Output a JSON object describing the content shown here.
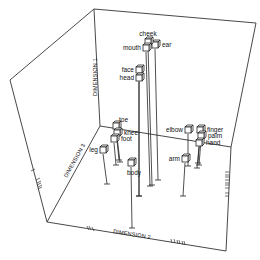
{
  "chart_data": {
    "type": "scatter",
    "subtype": "3d-scatter-with-drop-lines",
    "title": "",
    "axes": {
      "x": {
        "label": "DIMENSION 2"
      },
      "y": {
        "label": "DIMENSION 3"
      },
      "z": {
        "label": "DIMENSION 1"
      }
    },
    "grid": false,
    "legend": null,
    "points": [
      {
        "label": "cheek",
        "screen": [
          148,
          42
        ],
        "floor": [
          152,
          185
        ]
      },
      {
        "label": "mouth",
        "screen": [
          146,
          48
        ],
        "floor": [
          150,
          186
        ]
      },
      {
        "label": "ear",
        "screen": [
          155,
          45
        ],
        "floor": [
          158,
          180
        ]
      },
      {
        "label": "face",
        "screen": [
          139,
          70
        ],
        "floor": [
          139,
          196
        ]
      },
      {
        "label": "head",
        "screen": [
          139,
          78
        ],
        "floor": [
          139,
          196
        ]
      },
      {
        "label": "toe",
        "screen": [
          116,
          126
        ],
        "floor": [
          119,
          160
        ]
      },
      {
        "label": "knee",
        "screen": [
          117,
          133
        ],
        "floor": [
          120,
          162
        ]
      },
      {
        "label": "foot",
        "screen": [
          114,
          139
        ],
        "floor": [
          116,
          165
        ]
      },
      {
        "label": "leg",
        "screen": [
          103,
          150
        ],
        "floor": [
          107,
          184
        ]
      },
      {
        "label": "body",
        "screen": [
          131,
          163
        ],
        "floor": [
          132,
          228
        ]
      },
      {
        "label": "elbow",
        "screen": [
          188,
          130
        ],
        "floor": [
          188,
          166
        ]
      },
      {
        "label": "finger",
        "screen": [
          200,
          130
        ],
        "floor": [
          198,
          163
        ]
      },
      {
        "label": "palm",
        "screen": [
          201,
          136
        ],
        "floor": [
          199,
          165
        ]
      },
      {
        "label": "hand",
        "screen": [
          199,
          143
        ],
        "floor": [
          197,
          168
        ]
      },
      {
        "label": "arm",
        "screen": [
          185,
          159
        ],
        "floor": [
          183,
          196
        ]
      }
    ],
    "tick_marks": {
      "left_front_edge": "cluster of tick marks (rug plot) along DIMENSION 3 edge",
      "bottom_front_edge": "two clusters of tick marks along DIMENSION 2 edge",
      "right_front_edge": "cluster of tick marks along vertical edge"
    }
  },
  "labels": {
    "dim1": "DIMENSION 1",
    "dim2": "DIMENSION 2",
    "dim3": "DIMENSION 3"
  }
}
